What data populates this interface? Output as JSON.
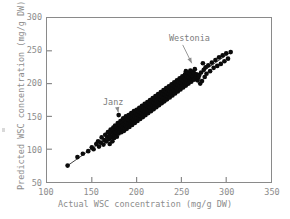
{
  "figure": {
    "background_color": "#ffffff",
    "frame_color": "#8a8a8a",
    "point_color": "#0b0b0b",
    "label_color": "#8c8c8c"
  },
  "chart_data": {
    "type": "scatter",
    "title": "",
    "xlabel": "Actual WSC concentration (mg/g DW)",
    "ylabel": "Predicted WSC concentration (mg/g DW)",
    "xlim": [
      100,
      350
    ],
    "ylim": [
      50,
      300
    ],
    "xticks": [
      100,
      150,
      200,
      250,
      300,
      350
    ],
    "yticks": [
      50,
      100,
      150,
      200,
      250,
      300
    ],
    "grid": false,
    "legend": null,
    "series": [
      {
        "name": "samples",
        "marker": "filled-circle",
        "color": "#0b0b0b",
        "points": [
          [
            123,
            75
          ],
          [
            134,
            88
          ],
          [
            140,
            93
          ],
          [
            146,
            97
          ],
          [
            150,
            103
          ],
          [
            152,
            100
          ],
          [
            155,
            108
          ],
          [
            157,
            112
          ],
          [
            158,
            104
          ],
          [
            160,
            110
          ],
          [
            161,
            118
          ],
          [
            163,
            107
          ],
          [
            164,
            114
          ],
          [
            165,
            122
          ],
          [
            166,
            112
          ],
          [
            167,
            119
          ],
          [
            168,
            126
          ],
          [
            169,
            115
          ],
          [
            170,
            108
          ],
          [
            170,
            121
          ],
          [
            171,
            130
          ],
          [
            172,
            118
          ],
          [
            172,
            126
          ],
          [
            173,
            112
          ],
          [
            174,
            123
          ],
          [
            174,
            133
          ],
          [
            175,
            117
          ],
          [
            175,
            128
          ],
          [
            176,
            136
          ],
          [
            176,
            121
          ],
          [
            177,
            130
          ],
          [
            177,
            125
          ],
          [
            178,
            134
          ],
          [
            178,
            119
          ],
          [
            179,
            128
          ],
          [
            179,
            140
          ],
          [
            180,
            124
          ],
          [
            180,
            132
          ],
          [
            180,
            152
          ],
          [
            181,
            127
          ],
          [
            181,
            137
          ],
          [
            182,
            131
          ],
          [
            182,
            143
          ],
          [
            183,
            126
          ],
          [
            183,
            135
          ],
          [
            184,
            130
          ],
          [
            184,
            141
          ],
          [
            185,
            133
          ],
          [
            185,
            147
          ],
          [
            186,
            128
          ],
          [
            186,
            138
          ],
          [
            187,
            132
          ],
          [
            187,
            144
          ],
          [
            188,
            136
          ],
          [
            188,
            150
          ],
          [
            189,
            131
          ],
          [
            189,
            141
          ],
          [
            190,
            135
          ],
          [
            190,
            146
          ],
          [
            191,
            139
          ],
          [
            191,
            152
          ],
          [
            192,
            134
          ],
          [
            192,
            144
          ],
          [
            193,
            138
          ],
          [
            193,
            149
          ],
          [
            194,
            142
          ],
          [
            194,
            155
          ],
          [
            195,
            137
          ],
          [
            195,
            147
          ],
          [
            196,
            141
          ],
          [
            196,
            152
          ],
          [
            197,
            145
          ],
          [
            197,
            158
          ],
          [
            198,
            140
          ],
          [
            198,
            150
          ],
          [
            199,
            144
          ],
          [
            199,
            155
          ],
          [
            200,
            148
          ],
          [
            200,
            160
          ],
          [
            201,
            143
          ],
          [
            201,
            153
          ],
          [
            202,
            147
          ],
          [
            202,
            158
          ],
          [
            203,
            151
          ],
          [
            203,
            163
          ],
          [
            204,
            146
          ],
          [
            204,
            156
          ],
          [
            205,
            150
          ],
          [
            205,
            161
          ],
          [
            206,
            154
          ],
          [
            206,
            166
          ],
          [
            207,
            149
          ],
          [
            207,
            159
          ],
          [
            208,
            153
          ],
          [
            208,
            164
          ],
          [
            209,
            157
          ],
          [
            209,
            169
          ],
          [
            210,
            152
          ],
          [
            210,
            162
          ],
          [
            211,
            156
          ],
          [
            211,
            167
          ],
          [
            212,
            160
          ],
          [
            212,
            172
          ],
          [
            213,
            155
          ],
          [
            213,
            165
          ],
          [
            214,
            159
          ],
          [
            214,
            170
          ],
          [
            215,
            163
          ],
          [
            215,
            175
          ],
          [
            216,
            158
          ],
          [
            216,
            168
          ],
          [
            217,
            162
          ],
          [
            217,
            173
          ],
          [
            218,
            166
          ],
          [
            218,
            178
          ],
          [
            219,
            161
          ],
          [
            219,
            171
          ],
          [
            220,
            165
          ],
          [
            220,
            176
          ],
          [
            221,
            169
          ],
          [
            221,
            181
          ],
          [
            222,
            164
          ],
          [
            222,
            174
          ],
          [
            223,
            168
          ],
          [
            223,
            179
          ],
          [
            224,
            172
          ],
          [
            224,
            184
          ],
          [
            225,
            167
          ],
          [
            225,
            177
          ],
          [
            226,
            171
          ],
          [
            226,
            182
          ],
          [
            227,
            175
          ],
          [
            227,
            187
          ],
          [
            228,
            170
          ],
          [
            228,
            180
          ],
          [
            229,
            174
          ],
          [
            229,
            185
          ],
          [
            230,
            178
          ],
          [
            230,
            190
          ],
          [
            231,
            173
          ],
          [
            231,
            183
          ],
          [
            232,
            177
          ],
          [
            232,
            188
          ],
          [
            233,
            181
          ],
          [
            233,
            193
          ],
          [
            234,
            176
          ],
          [
            234,
            186
          ],
          [
            235,
            180
          ],
          [
            235,
            191
          ],
          [
            236,
            184
          ],
          [
            236,
            196
          ],
          [
            237,
            179
          ],
          [
            237,
            189
          ],
          [
            238,
            183
          ],
          [
            238,
            194
          ],
          [
            239,
            187
          ],
          [
            239,
            199
          ],
          [
            240,
            182
          ],
          [
            240,
            192
          ],
          [
            241,
            186
          ],
          [
            241,
            197
          ],
          [
            242,
            190
          ],
          [
            242,
            202
          ],
          [
            243,
            185
          ],
          [
            243,
            195
          ],
          [
            244,
            189
          ],
          [
            244,
            200
          ],
          [
            245,
            193
          ],
          [
            245,
            205
          ],
          [
            246,
            188
          ],
          [
            246,
            198
          ],
          [
            247,
            192
          ],
          [
            247,
            203
          ],
          [
            248,
            196
          ],
          [
            248,
            208
          ],
          [
            249,
            191
          ],
          [
            249,
            201
          ],
          [
            250,
            195
          ],
          [
            250,
            206
          ],
          [
            251,
            199
          ],
          [
            251,
            211
          ],
          [
            252,
            194
          ],
          [
            252,
            204
          ],
          [
            253,
            198
          ],
          [
            253,
            209
          ],
          [
            254,
            202
          ],
          [
            254,
            214
          ],
          [
            255,
            197
          ],
          [
            255,
            207
          ],
          [
            255,
            219
          ],
          [
            256,
            201
          ],
          [
            256,
            212
          ],
          [
            257,
            205
          ],
          [
            257,
            217
          ],
          [
            258,
            200
          ],
          [
            258,
            210
          ],
          [
            259,
            204
          ],
          [
            259,
            215
          ],
          [
            260,
            208
          ],
          [
            260,
            220
          ],
          [
            261,
            203
          ],
          [
            261,
            213
          ],
          [
            262,
            207
          ],
          [
            262,
            218
          ],
          [
            263,
            211
          ],
          [
            264,
            206
          ],
          [
            264,
            216
          ],
          [
            265,
            222
          ],
          [
            266,
            210
          ],
          [
            267,
            214
          ],
          [
            268,
            205
          ],
          [
            269,
            209
          ],
          [
            270,
            213
          ],
          [
            271,
            200
          ],
          [
            272,
            217
          ],
          [
            273,
            204
          ],
          [
            274,
            231
          ],
          [
            275,
            221
          ],
          [
            276,
            210
          ],
          [
            277,
            225
          ],
          [
            278,
            215
          ],
          [
            280,
            228
          ],
          [
            282,
            219
          ],
          [
            284,
            232
          ],
          [
            286,
            224
          ],
          [
            288,
            236
          ],
          [
            290,
            227
          ],
          [
            292,
            240
          ],
          [
            294,
            230
          ],
          [
            296,
            243
          ],
          [
            298,
            234
          ],
          [
            300,
            246
          ],
          [
            302,
            238
          ],
          [
            305,
            248
          ]
        ]
      }
    ],
    "trend_line": {
      "name": "1:1 regression line",
      "color": "#2a2a2a",
      "start": [
        123,
        75
      ],
      "end": [
        305,
        248
      ]
    },
    "annotations": [
      {
        "label": "Janz",
        "text_x": 163,
        "text_y": 172,
        "target_x": 184,
        "target_y": 150
      },
      {
        "label": "Westonia",
        "text_x": 236,
        "text_y": 268,
        "target_x": 266,
        "target_y": 225
      }
    ]
  }
}
